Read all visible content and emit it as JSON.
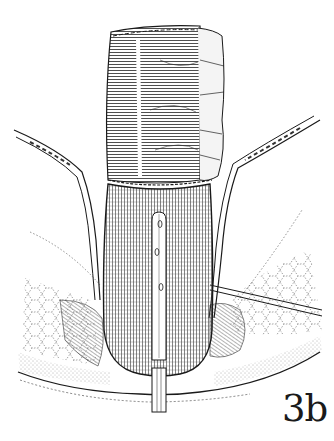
{
  "figure": {
    "label": "3b",
    "style": "black-and-white anatomical line drawing",
    "colors": {
      "ink": "#1a1a1a",
      "background": "#ffffff",
      "stipple": "#555555"
    }
  }
}
